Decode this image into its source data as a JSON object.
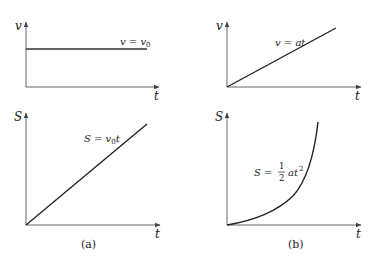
{
  "figure": {
    "panels": [
      {
        "id": "a",
        "caption": "(a)",
        "top_graph": {
          "y_axis_label": "v",
          "x_axis_label": "t",
          "curve_label_lhs": "v = v",
          "curve_label_sub": "0",
          "curve_type": "constant"
        },
        "bottom_graph": {
          "y_axis_label": "S",
          "x_axis_label": "t",
          "curve_label_lhs": "S = v",
          "curve_label_sub": "0",
          "curve_label_tail": "t",
          "curve_type": "linear"
        }
      },
      {
        "id": "b",
        "caption": "(b)",
        "top_graph": {
          "y_axis_label": "v",
          "x_axis_label": "t",
          "curve_label": "v = at",
          "curve_type": "linear"
        },
        "bottom_graph": {
          "y_axis_label": "S",
          "x_axis_label": "t",
          "curve_label_lhs": "S =",
          "fraction_num": "1",
          "fraction_den": "2",
          "curve_label_tail": "at",
          "curve_label_sup": "2",
          "curve_type": "quadratic"
        }
      }
    ],
    "colors": {
      "axis": "#555555",
      "curve": "#222222",
      "text": "#222222"
    }
  }
}
